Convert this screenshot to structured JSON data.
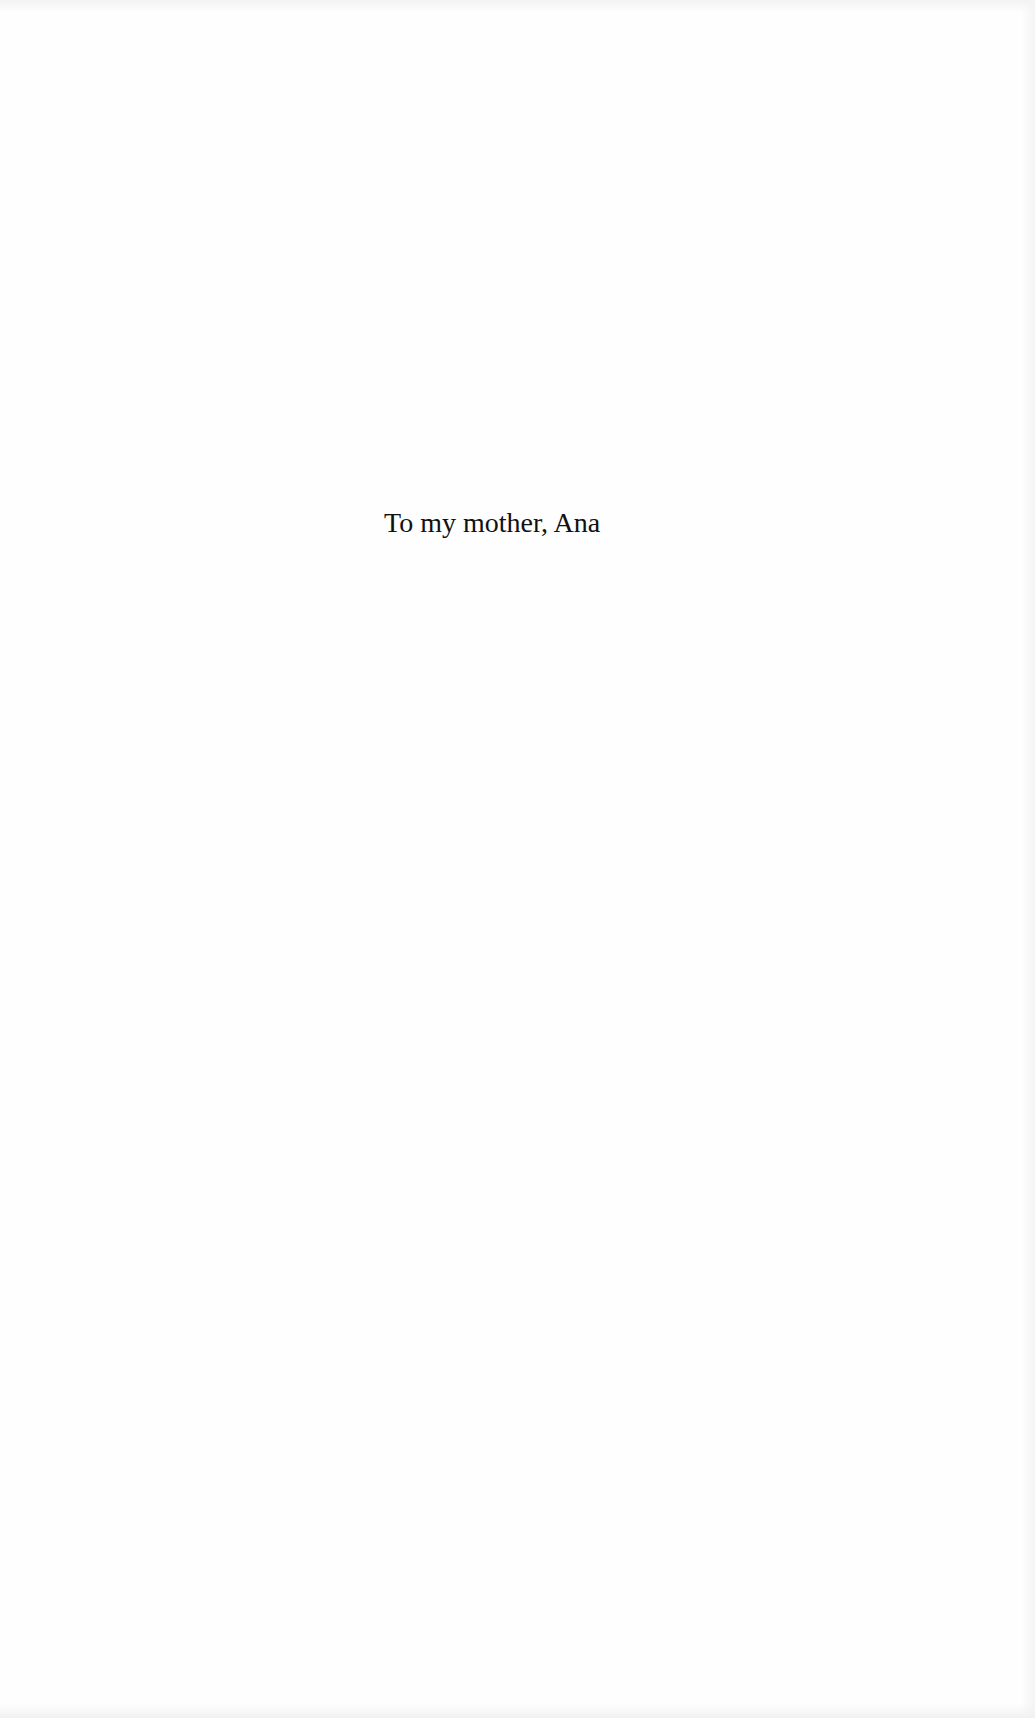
{
  "page": {
    "type": "dedication",
    "dedication_text": "To my mother, Ana"
  },
  "colors": {
    "background": "#fefefe",
    "text": "#111111"
  }
}
